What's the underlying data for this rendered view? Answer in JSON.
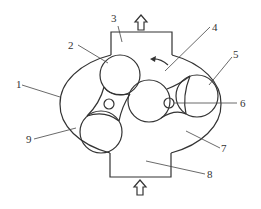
{
  "diagram": {
    "type": "twin-screw / gear pump cross-section",
    "labels": [
      {
        "id": "1",
        "text": "1",
        "part": "housing"
      },
      {
        "id": "2",
        "text": "2",
        "part": "rotor-top-left"
      },
      {
        "id": "3",
        "text": "3",
        "part": "outlet-port"
      },
      {
        "id": "4",
        "text": "4",
        "part": "upper-chamber"
      },
      {
        "id": "5",
        "text": "5",
        "part": "rotor-right"
      },
      {
        "id": "6",
        "text": "6",
        "part": "central-rotor-axis"
      },
      {
        "id": "7",
        "text": "7",
        "part": "lower-chamber"
      },
      {
        "id": "8",
        "text": "8",
        "part": "inlet-port"
      },
      {
        "id": "9",
        "text": "9",
        "part": "rotor-bottom-left"
      }
    ],
    "arrows": {
      "outlet": "up-arrow",
      "inlet": "up-arrow",
      "rotation": "counterclockwise-arrow"
    },
    "colors": {
      "stroke": "#333333",
      "background": "#ffffff"
    }
  }
}
